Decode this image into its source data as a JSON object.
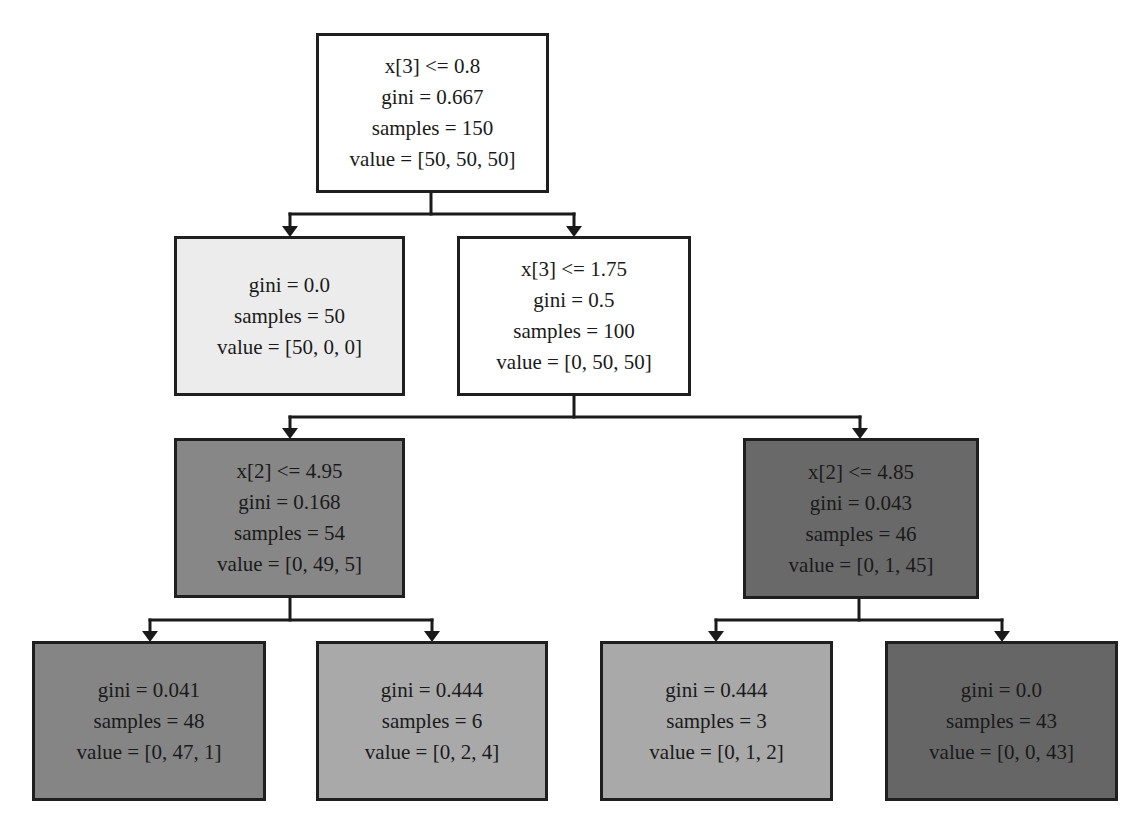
{
  "diagram": {
    "type": "decision-tree",
    "nodes": [
      {
        "id": "n0",
        "split": "x[3] <= 0.8",
        "gini": "gini = 0.667",
        "samples": "samples = 150",
        "value": "value = [50, 50, 50]",
        "fill": "#ffffff",
        "box": {
          "x": 316,
          "y": 33,
          "w": 233,
          "h": 160
        }
      },
      {
        "id": "n1",
        "split": null,
        "gini": "gini = 0.0",
        "samples": "samples = 50",
        "value": "value = [50, 0, 0]",
        "fill": "#ececec",
        "box": {
          "x": 174,
          "y": 236,
          "w": 231,
          "h": 160
        }
      },
      {
        "id": "n2",
        "split": "x[3] <= 1.75",
        "gini": "gini = 0.5",
        "samples": "samples = 100",
        "value": "value = [0, 50, 50]",
        "fill": "#ffffff",
        "box": {
          "x": 457,
          "y": 236,
          "w": 234,
          "h": 160
        }
      },
      {
        "id": "n3",
        "split": "x[2] <= 4.95",
        "gini": "gini = 0.168",
        "samples": "samples = 54",
        "value": "value = [0, 49, 5]",
        "fill": "#878787",
        "box": {
          "x": 174,
          "y": 438,
          "w": 231,
          "h": 160
        }
      },
      {
        "id": "n4",
        "split": "x[2] <= 4.85",
        "gini": "gini = 0.043",
        "samples": "samples = 46",
        "value": "value = [0, 1, 45]",
        "fill": "#696969",
        "box": {
          "x": 743,
          "y": 438,
          "w": 236,
          "h": 161
        }
      },
      {
        "id": "n5",
        "split": null,
        "gini": "gini = 0.041",
        "samples": "samples = 48",
        "value": "value = [0, 47, 1]",
        "fill": "#858585",
        "box": {
          "x": 32,
          "y": 641,
          "w": 234,
          "h": 160
        }
      },
      {
        "id": "n6",
        "split": null,
        "gini": "gini = 0.444",
        "samples": "samples = 6",
        "value": "value = [0, 2, 4]",
        "fill": "#a9a9a9",
        "box": {
          "x": 316,
          "y": 641,
          "w": 232,
          "h": 160
        }
      },
      {
        "id": "n7",
        "split": null,
        "gini": "gini = 0.444",
        "samples": "samples = 3",
        "value": "value = [0, 1, 2]",
        "fill": "#a9a9a9",
        "box": {
          "x": 600,
          "y": 641,
          "w": 233,
          "h": 160
        }
      },
      {
        "id": "n8",
        "split": null,
        "gini": "gini = 0.0",
        "samples": "samples = 43",
        "value": "value = [0, 0, 43]",
        "fill": "#666666",
        "box": {
          "x": 885,
          "y": 641,
          "w": 233,
          "h": 160
        }
      }
    ],
    "edges": [
      {
        "from": "n0",
        "to": "n1"
      },
      {
        "from": "n0",
        "to": "n2"
      },
      {
        "from": "n2",
        "to": "n3"
      },
      {
        "from": "n2",
        "to": "n4"
      },
      {
        "from": "n3",
        "to": "n5"
      },
      {
        "from": "n3",
        "to": "n6"
      },
      {
        "from": "n4",
        "to": "n7"
      },
      {
        "from": "n4",
        "to": "n8"
      }
    ],
    "connectors": [
      {
        "parent_x": 431,
        "parent_bottom": 193,
        "bar_y": 214,
        "children": [
          {
            "x": 290,
            "top": 236
          },
          {
            "x": 574,
            "top": 236
          }
        ]
      },
      {
        "parent_x": 574,
        "parent_bottom": 396,
        "bar_y": 417,
        "children": [
          {
            "x": 290,
            "top": 438
          },
          {
            "x": 860,
            "top": 438
          }
        ]
      },
      {
        "parent_x": 290,
        "parent_bottom": 598,
        "bar_y": 620,
        "children": [
          {
            "x": 150,
            "top": 641
          },
          {
            "x": 432,
            "top": 641
          }
        ]
      },
      {
        "parent_x": 859,
        "parent_bottom": 599,
        "bar_y": 620,
        "children": [
          {
            "x": 716,
            "top": 641
          },
          {
            "x": 1002,
            "top": 641
          }
        ]
      }
    ],
    "colors": {
      "border": "#1f1f1f",
      "edge": "#1a1a1a",
      "text": "#1a1a1a",
      "background": "#ffffff"
    }
  }
}
